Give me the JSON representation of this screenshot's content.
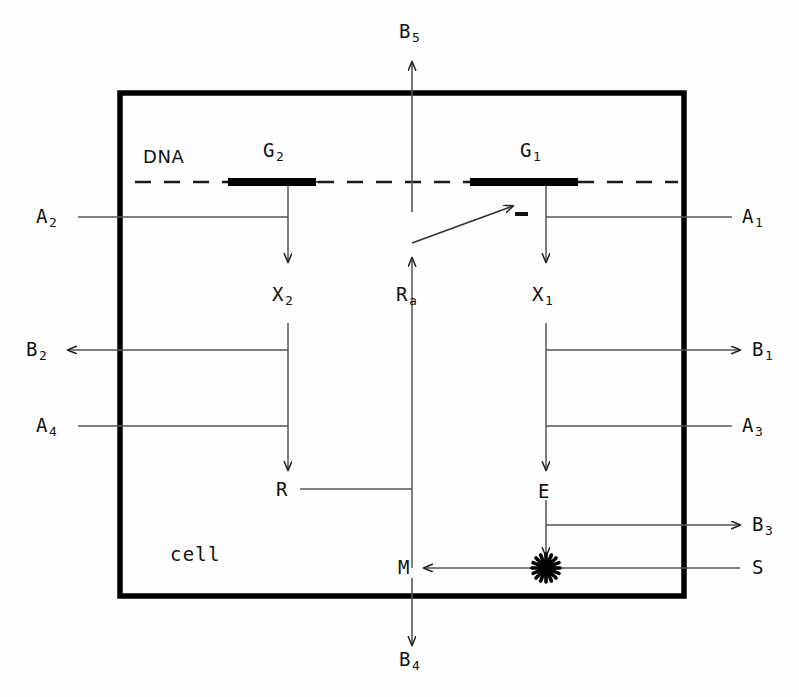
{
  "diagram": {
    "container_label": "cell",
    "dna_label": "DNA",
    "colors": {
      "ink": "#111111",
      "line": "#444444",
      "membrane": "#000000",
      "background": "#fefefe"
    },
    "genes": [
      {
        "id": "G2",
        "base": "G",
        "sub": "2",
        "label": "G2"
      },
      {
        "id": "G1",
        "base": "G",
        "sub": "1",
        "label": "G1"
      }
    ],
    "products": [
      {
        "id": "X2",
        "base": "X",
        "sub": "2"
      },
      {
        "id": "X1",
        "base": "X",
        "sub": "1"
      },
      {
        "id": "R",
        "base": "R",
        "sub": ""
      },
      {
        "id": "E",
        "base": "E",
        "sub": ""
      },
      {
        "id": "M",
        "base": "M",
        "sub": ""
      },
      {
        "id": "Ra",
        "base": "R",
        "sub": "a"
      }
    ],
    "inputs": [
      {
        "id": "A1",
        "base": "A",
        "sub": "1",
        "side": "right",
        "direction": "inward"
      },
      {
        "id": "A2",
        "base": "A",
        "sub": "2",
        "side": "left",
        "direction": "inward"
      },
      {
        "id": "A3",
        "base": "A",
        "sub": "3",
        "side": "right",
        "direction": "inward"
      },
      {
        "id": "A4",
        "base": "A",
        "sub": "4",
        "side": "left",
        "direction": "inward"
      },
      {
        "id": "S",
        "base": "S",
        "sub": "",
        "side": "right",
        "direction": "inward"
      }
    ],
    "outputs": [
      {
        "id": "B1",
        "base": "B",
        "sub": "1",
        "side": "right",
        "direction": "outward"
      },
      {
        "id": "B2",
        "base": "B",
        "sub": "2",
        "side": "left",
        "direction": "outward"
      },
      {
        "id": "B3",
        "base": "B",
        "sub": "3",
        "side": "right",
        "direction": "outward"
      },
      {
        "id": "B4",
        "base": "B",
        "sub": "4",
        "side": "bottom",
        "direction": "outward"
      },
      {
        "id": "B5",
        "base": "B",
        "sub": "5",
        "side": "top",
        "direction": "outward"
      }
    ],
    "regulation": {
      "sign": "-",
      "from": "Ra",
      "to": "G1",
      "type": "inhibition"
    },
    "reaction_marker": {
      "id": "burst",
      "at": "E-S-M junction",
      "symbol": "starburst"
    }
  }
}
